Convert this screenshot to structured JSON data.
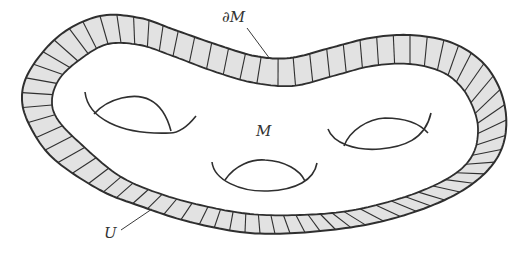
{
  "figure": {
    "labels": {
      "boundary": "∂M",
      "manifold": "M",
      "collar": "U"
    },
    "holes": 3,
    "colors": {
      "collar_fill": "#e2e2e2",
      "stroke": "#2f2f2f",
      "background": "#ffffff",
      "text": "#333333"
    }
  }
}
